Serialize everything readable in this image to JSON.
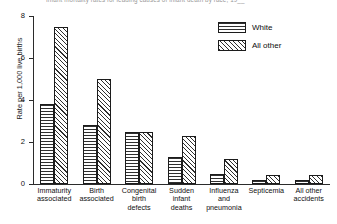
{
  "chart_data": {
    "type": "bar",
    "title": "Infant mortality rates for leading causes of infant death by race, 19__",
    "xlabel": "",
    "ylabel": "Rate per 1,000 live births",
    "ylim": [
      0,
      8
    ],
    "yticks": [
      0,
      2,
      4,
      6,
      8
    ],
    "ytick_labels": [
      "0",
      "2",
      "4",
      "6",
      "8"
    ],
    "grid": false,
    "legend_position": "top-right",
    "categories": [
      "Immaturity associated",
      "Birth associated",
      "Congenital birth defects",
      "Sudden infant deaths",
      "Influenza and pneumonia",
      "Septicemia",
      "All other accidents"
    ],
    "category_lines": [
      [
        "Immaturity",
        "associated"
      ],
      [
        "Birth",
        "associated"
      ],
      [
        "Congenital",
        "birth",
        "defects"
      ],
      [
        "Sudden",
        "infant",
        "deaths"
      ],
      [
        "Influenza",
        "and",
        "pneumonia"
      ],
      [
        "Septicemia"
      ],
      [
        "All other",
        "accidents"
      ]
    ],
    "series": [
      {
        "name": "White",
        "pattern": "horizontal-stripes",
        "values": [
          3.8,
          2.8,
          2.5,
          1.3,
          0.5,
          0.2,
          0.2
        ]
      },
      {
        "name": "All other",
        "pattern": "diagonal-stripes",
        "values": [
          7.5,
          5.0,
          2.5,
          2.3,
          1.2,
          0.45,
          0.45
        ]
      }
    ]
  },
  "legend": {
    "items": [
      {
        "label": "White"
      },
      {
        "label": "All other"
      }
    ]
  },
  "colors": {
    "background": "#ffffff",
    "axis": "#2b2b2b",
    "ink": "#101010",
    "hatch": "#2f2f2f"
  }
}
